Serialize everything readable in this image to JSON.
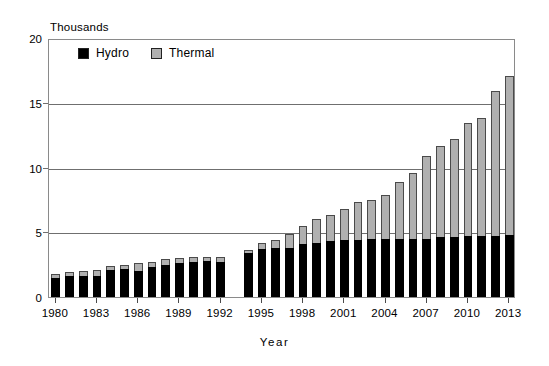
{
  "chart_data": {
    "type": "bar",
    "subtype": "stacked-vertical",
    "title": "",
    "units_caption": "Thousands",
    "xlabel": "Year",
    "ylabel": "",
    "ylim": [
      0,
      20
    ],
    "yticks": [
      0,
      5,
      10,
      15,
      20
    ],
    "ytick_labels": [
      "0",
      "5",
      "10",
      "15",
      "20"
    ],
    "grid": "horizontal",
    "legend_position": "top-left-inside",
    "categories": [
      "1980",
      "1981",
      "1982",
      "1983",
      "1984",
      "1985",
      "1986",
      "1987",
      "1988",
      "1989",
      "1990",
      "1991",
      "1992",
      "1993",
      "1994",
      "1995",
      "1996",
      "1997",
      "1998",
      "1999",
      "2000",
      "2001",
      "2002",
      "2003",
      "2004",
      "2005",
      "2006",
      "2007",
      "2008",
      "2009",
      "2010",
      "2011",
      "2012",
      "2013"
    ],
    "xtick_labels": [
      "1980",
      "1983",
      "1986",
      "1989",
      "1992",
      "1995",
      "1998",
      "2001",
      "2004",
      "2007",
      "2010",
      "2013"
    ],
    "series": [
      {
        "name": "Hydro",
        "color": "#000000",
        "values": [
          1.5,
          1.6,
          1.6,
          1.6,
          2.1,
          2.2,
          2.0,
          2.3,
          2.5,
          2.6,
          2.7,
          2.8,
          2.7,
          0.0,
          3.4,
          3.7,
          3.8,
          3.8,
          4.1,
          4.2,
          4.3,
          4.4,
          4.4,
          4.5,
          4.5,
          4.5,
          4.5,
          4.5,
          4.6,
          4.6,
          4.7,
          4.7,
          4.7,
          4.8
        ]
      },
      {
        "name": "Thermal",
        "color": "#b0b0b0",
        "values": [
          0.3,
          0.3,
          0.4,
          0.5,
          0.3,
          0.3,
          0.6,
          0.4,
          0.4,
          0.4,
          0.4,
          0.3,
          0.4,
          0.0,
          0.2,
          0.5,
          0.6,
          1.1,
          1.4,
          1.8,
          2.0,
          2.4,
          2.9,
          3.0,
          3.4,
          4.4,
          5.1,
          6.4,
          7.1,
          7.6,
          8.7,
          9.1,
          11.2,
          12.3
        ]
      }
    ],
    "totals": [
      1.8,
      1.9,
      2.0,
      2.1,
      2.4,
      2.5,
      2.6,
      2.7,
      2.9,
      3.0,
      3.1,
      3.1,
      3.1,
      0.0,
      3.6,
      4.2,
      4.4,
      4.9,
      5.5,
      6.0,
      6.3,
      6.8,
      7.3,
      7.5,
      7.9,
      8.9,
      9.6,
      10.9,
      11.7,
      12.2,
      13.4,
      13.8,
      15.9,
      17.1
    ],
    "missing_categories": [
      "1993"
    ]
  },
  "legend": {
    "items": [
      {
        "label": "Hydro",
        "color": "#000000"
      },
      {
        "label": "Thermal",
        "color": "#b0b0b0"
      }
    ]
  }
}
